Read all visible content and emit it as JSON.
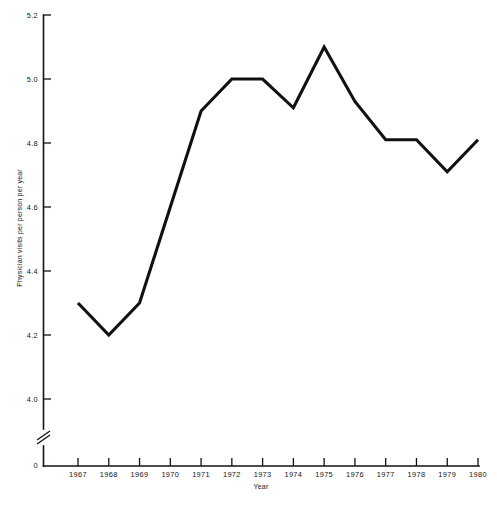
{
  "chart_data": {
    "type": "line",
    "title": "",
    "subtitle": "",
    "xlabel": "Year",
    "ylabel": "Physician visits per person per year",
    "x": [
      1967,
      1968,
      1969,
      1970,
      1971,
      1972,
      1973,
      1974,
      1975,
      1976,
      1977,
      1978,
      1979,
      1980
    ],
    "xtick_labels": [
      "1967",
      "1968",
      "1969",
      "1970",
      "1971",
      "1972",
      "1973",
      "1974",
      "1975",
      "1976",
      "1977",
      "1978",
      "1979",
      "1980"
    ],
    "values": [
      4.3,
      4.2,
      4.3,
      4.6,
      4.9,
      5.0,
      5.0,
      4.91,
      5.1,
      4.93,
      4.81,
      4.81,
      4.71,
      4.81
    ],
    "series": [
      {
        "name": "Physician visits per person per year",
        "values": [
          4.3,
          4.2,
          4.3,
          4.6,
          4.9,
          5.0,
          5.0,
          4.91,
          5.1,
          4.93,
          4.81,
          4.81,
          4.71,
          4.81
        ]
      }
    ],
    "ytick_labels": [
      "5.2",
      "5.0",
      "4.8",
      "4.6",
      "4.4",
      "4.2",
      "4.0",
      "0"
    ],
    "ytick_values": [
      5.2,
      5.0,
      4.8,
      4.6,
      4.4,
      4.2,
      4.0,
      0
    ],
    "ylim": [
      3.9,
      5.2
    ],
    "xlim": [
      1967,
      1980
    ],
    "axis_break": true,
    "axis_break_label": "y-axis-break",
    "grid": false,
    "legend": "none",
    "line_color": "#111111",
    "axis_color": "#111111",
    "background_color": "#ffffff"
  },
  "caption": {
    "text": ""
  }
}
